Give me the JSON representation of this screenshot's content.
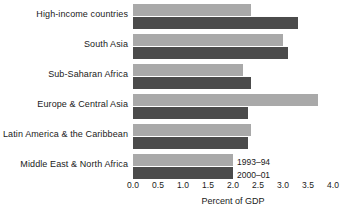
{
  "chart_data": {
    "type": "bar",
    "orientation": "horizontal",
    "title": "",
    "xlabel": "Percent of GDP",
    "ylabel": "",
    "xlim": [
      0.0,
      4.0
    ],
    "xticks": [
      "0.0",
      "0.5",
      "1.0",
      "1.5",
      "2.0",
      "2.5",
      "3.0",
      "3.5",
      "4.0"
    ],
    "xtick_values": [
      0.0,
      0.5,
      1.0,
      1.5,
      2.0,
      2.5,
      3.0,
      3.5,
      4.0
    ],
    "grid": false,
    "legend_position": "inside-right-bottom-group",
    "categories": [
      "High-income countries",
      "South Asia",
      "Sub-Saharan Africa",
      "Europe & Central Asia",
      "Latin America & the Caribbean",
      "Middle East & North Africa"
    ],
    "series": [
      {
        "name": "1993–94",
        "color": "#a9a9a9",
        "values": [
          2.35,
          3.0,
          2.2,
          3.7,
          2.35,
          2.0
        ]
      },
      {
        "name": "2000–01",
        "color": "#4b4b4b",
        "values": [
          3.3,
          3.1,
          2.35,
          2.3,
          2.3,
          2.0
        ]
      }
    ]
  },
  "legend": {
    "items": [
      {
        "label": "1993–94"
      },
      {
        "label": "2000–01"
      }
    ]
  },
  "colors": {
    "series_light": "#a9a9a9",
    "series_dark": "#4b4b4b",
    "text": "#1a1a1a",
    "background": "#ffffff"
  }
}
